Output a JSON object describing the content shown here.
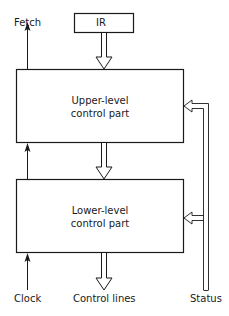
{
  "diagram": {
    "ir_box": {
      "label": "IR"
    },
    "upper_box": {
      "line1": "Upper-level",
      "line2": "control part"
    },
    "lower_box": {
      "line1": "Lower-level",
      "line2": "control part"
    },
    "labels": {
      "fetch": "Fetch",
      "clock": "Clock",
      "control_lines": "Control lines",
      "status": "Status"
    },
    "colors": {
      "stroke": "#1a1a1a",
      "background": "#ffffff"
    }
  }
}
